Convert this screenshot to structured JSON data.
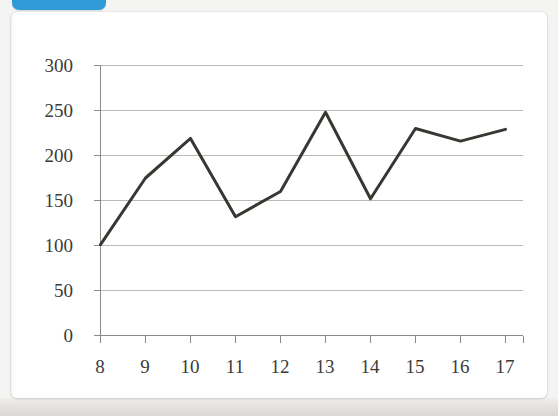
{
  "window": {
    "tab_color": "#2e9bd6",
    "card_background": "#ffffff",
    "page_background": "#f4f4f2"
  },
  "chart_data": {
    "type": "line",
    "title": "",
    "subtitle": "",
    "xlabel": "",
    "ylabel": "",
    "x": [
      8,
      9,
      10,
      11,
      12,
      13,
      14,
      15,
      16,
      17
    ],
    "values": [
      101,
      175,
      219,
      132,
      160,
      248,
      152,
      230,
      216,
      229
    ],
    "series": [
      {
        "name": "",
        "values": [
          101,
          175,
          219,
          132,
          160,
          248,
          152,
          230,
          216,
          229
        ],
        "color": "#3a3733",
        "line_width": 3,
        "markers": false
      }
    ],
    "categories": [
      "8",
      "9",
      "10",
      "11",
      "12",
      "13",
      "14",
      "15",
      "16",
      "17"
    ],
    "xtick_labels": [
      "8",
      "9",
      "10",
      "11",
      "12",
      "13",
      "14",
      "15",
      "16",
      "17"
    ],
    "ytick_labels": [
      "0",
      "50",
      "100",
      "150",
      "200",
      "250",
      "300"
    ],
    "ytick_values": [
      0,
      50,
      100,
      150,
      200,
      250,
      300
    ],
    "ylim": [
      0,
      300
    ],
    "xlim": [
      7.5,
      17.5
    ],
    "grid": {
      "horizontal": true,
      "vertical": false,
      "color": "#b9b9b6"
    },
    "legend": {
      "visible": false,
      "position": "none"
    },
    "axis": {
      "y_axis_line": true,
      "x_axis_line": true,
      "tick_marks": true,
      "color": "#7d7d79"
    },
    "annotations": []
  }
}
